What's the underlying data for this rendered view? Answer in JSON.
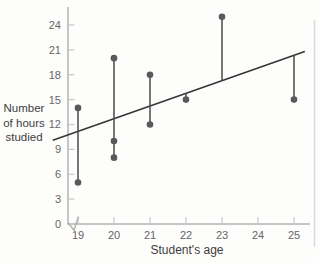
{
  "chart_data": {
    "type": "scatter",
    "title": "",
    "xlabel": "Student's age",
    "ylabel": "Number of hours studied",
    "ylabel_lines": [
      "Number",
      "of hours",
      "studied"
    ],
    "x_ticks": [
      19,
      20,
      21,
      22,
      23,
      24,
      25
    ],
    "y_ticks": [
      0,
      3,
      6,
      9,
      12,
      15,
      18,
      21,
      24
    ],
    "xlim": [
      18.3,
      25.5
    ],
    "ylim": [
      0,
      25.5
    ],
    "x_axis_break": true,
    "grid": false,
    "points": [
      {
        "x": 19,
        "y": 5
      },
      {
        "x": 19,
        "y": 14
      },
      {
        "x": 20,
        "y": 8
      },
      {
        "x": 20,
        "y": 10
      },
      {
        "x": 20,
        "y": 20
      },
      {
        "x": 21,
        "y": 12
      },
      {
        "x": 21,
        "y": 18
      },
      {
        "x": 22,
        "y": 15
      },
      {
        "x": 23,
        "y": 25
      },
      {
        "x": 25,
        "y": 15
      }
    ],
    "residual_segments": [
      {
        "x": 19,
        "y1": 5,
        "y2": 14
      },
      {
        "x": 20,
        "y1": 8,
        "y2": 20
      },
      {
        "x": 21,
        "y1": 12,
        "y2": 18
      },
      {
        "x": 22,
        "y1": 15,
        "y2": 15.8
      },
      {
        "x": 23,
        "y1": 17.3,
        "y2": 25
      },
      {
        "x": 25,
        "y1": 15,
        "y2": 20.4
      }
    ],
    "regression_line": {
      "slope": 1.53,
      "intercept": -17.9,
      "x_start": 18.3,
      "x_end": 25.3
    },
    "colors": {
      "point": "#59595d",
      "segment": "#4a4a4d",
      "line": "#363636",
      "axis": "#c6c6c6",
      "break_mark": "#b2b2b2",
      "tick_label": "#666666",
      "axis_label": "#3d3d3d",
      "page_border": "#dbdbdb",
      "background": "#fdfdfc"
    }
  }
}
